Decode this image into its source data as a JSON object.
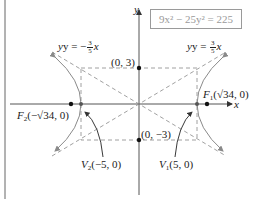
{
  "equation": "9x² − 25y² = 225",
  "axes": {
    "x_label": "x",
    "y_label": "y"
  },
  "asymptotes": {
    "left": {
      "prefix": "y = −",
      "num": "3",
      "den": "5",
      "var": "x"
    },
    "right": {
      "prefix": "y = ",
      "num": "3",
      "den": "5",
      "var": "x"
    }
  },
  "points": {
    "co_vertex_top": "(0, 3)",
    "co_vertex_bottom": "(0, −3)",
    "focus_right": {
      "name": "F",
      "sub": "1",
      "coords": "(√34, 0)"
    },
    "focus_left": {
      "name": "F",
      "sub": "2",
      "coords": "(−√34, 0)"
    },
    "vertex_left": {
      "name": "V",
      "sub": "2",
      "coords": "(−5, 0)"
    },
    "vertex_right": {
      "name": "V",
      "sub": "1",
      "coords": "(5, 0)"
    }
  },
  "colors": {
    "axis": "#555555",
    "curve": "#8a8a8a",
    "dashed": "#888888",
    "point": "#111111",
    "box_border": "#9a9a9a"
  }
}
